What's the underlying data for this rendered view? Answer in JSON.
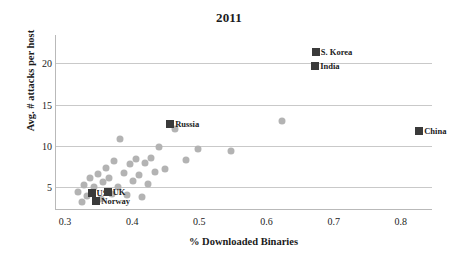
{
  "chart_data": {
    "type": "scatter",
    "title": "2011",
    "xlabel": "% Downloaded Binaries",
    "ylabel": "Avg. # attacks per host",
    "xlim": [
      0.285,
      0.845
    ],
    "ylim": [
      2.4,
      23.4
    ],
    "xticks": [
      "0.3",
      "0.4",
      "0.5",
      "0.6",
      "0.7",
      "0.8"
    ],
    "xtick_values": [
      0.3,
      0.4,
      0.5,
      0.6,
      0.7,
      0.8
    ],
    "yticks": [
      "5",
      "10",
      "15",
      "20"
    ],
    "ytick_values": [
      5,
      10,
      15,
      20
    ],
    "grid": "horizontal",
    "legend": "none",
    "marker_unlabeled": "circle",
    "marker_labeled": "square",
    "color_unlabeled": "#b3b3b3",
    "color_labeled": "#3a3a3a",
    "labeled_points": [
      {
        "label": "S. Korea",
        "x": 0.672,
        "y": 21.3
      },
      {
        "label": "India",
        "x": 0.671,
        "y": 19.7
      },
      {
        "label": "China",
        "x": 0.826,
        "y": 11.8
      },
      {
        "label": "Russia",
        "x": 0.455,
        "y": 12.6
      },
      {
        "label": "US",
        "x": 0.338,
        "y": 4.3
      },
      {
        "label": "UK",
        "x": 0.362,
        "y": 4.5
      },
      {
        "label": "Norway",
        "x": 0.345,
        "y": 3.4
      }
    ],
    "unlabeled_points": [
      {
        "x": 0.318,
        "y": 4.4
      },
      {
        "x": 0.323,
        "y": 3.3
      },
      {
        "x": 0.327,
        "y": 5.3
      },
      {
        "x": 0.331,
        "y": 4.0
      },
      {
        "x": 0.336,
        "y": 6.1
      },
      {
        "x": 0.341,
        "y": 5.0
      },
      {
        "x": 0.347,
        "y": 6.6
      },
      {
        "x": 0.352,
        "y": 3.6
      },
      {
        "x": 0.355,
        "y": 5.6
      },
      {
        "x": 0.359,
        "y": 7.4
      },
      {
        "x": 0.364,
        "y": 6.2
      },
      {
        "x": 0.369,
        "y": 4.2
      },
      {
        "x": 0.372,
        "y": 8.2
      },
      {
        "x": 0.377,
        "y": 5.1
      },
      {
        "x": 0.381,
        "y": 10.9
      },
      {
        "x": 0.386,
        "y": 6.8
      },
      {
        "x": 0.39,
        "y": 4.1
      },
      {
        "x": 0.395,
        "y": 7.8
      },
      {
        "x": 0.399,
        "y": 5.8
      },
      {
        "x": 0.404,
        "y": 8.4
      },
      {
        "x": 0.409,
        "y": 6.5
      },
      {
        "x": 0.413,
        "y": 3.8
      },
      {
        "x": 0.418,
        "y": 7.9
      },
      {
        "x": 0.422,
        "y": 5.4
      },
      {
        "x": 0.427,
        "y": 8.6
      },
      {
        "x": 0.432,
        "y": 6.9
      },
      {
        "x": 0.438,
        "y": 9.9
      },
      {
        "x": 0.447,
        "y": 7.2
      },
      {
        "x": 0.462,
        "y": 12.0
      },
      {
        "x": 0.479,
        "y": 8.3
      },
      {
        "x": 0.497,
        "y": 9.7
      },
      {
        "x": 0.545,
        "y": 9.4
      },
      {
        "x": 0.621,
        "y": 13.0
      }
    ]
  }
}
